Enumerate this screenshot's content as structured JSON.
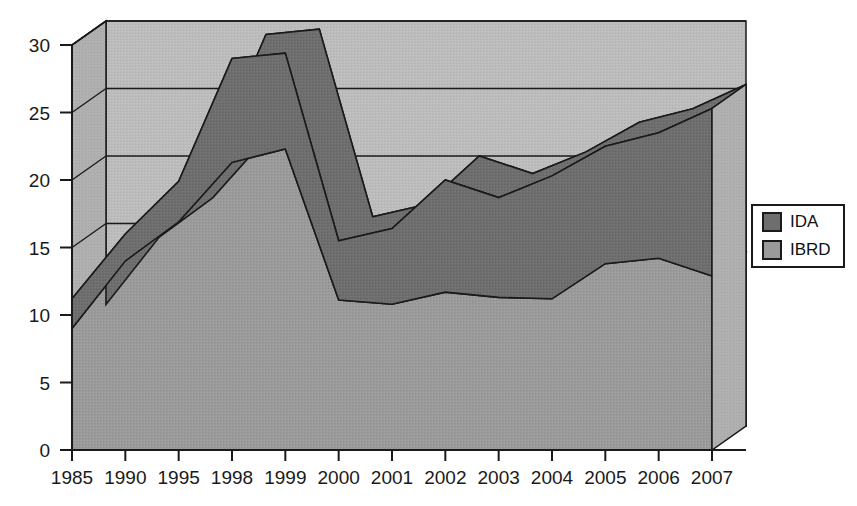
{
  "chart_data": {
    "type": "area",
    "stacked": true,
    "three_d": true,
    "title": "",
    "subtitle": "",
    "xlabel": "",
    "ylabel": "",
    "categories": [
      "1985",
      "1990",
      "1995",
      "1998",
      "1999",
      "2000",
      "2001",
      "2002",
      "2003",
      "2004",
      "2005",
      "2006",
      "2007"
    ],
    "series": [
      {
        "name": "IBRD",
        "color": "#9a9a9a",
        "values": [
          9.0,
          14.0,
          16.9,
          21.3,
          22.3,
          11.1,
          10.8,
          11.7,
          11.3,
          11.2,
          13.8,
          14.2,
          12.9
        ]
      },
      {
        "name": "IDA",
        "color": "#6e6e6e",
        "values": [
          2.2,
          2.0,
          3.0,
          7.7,
          7.1,
          4.4,
          5.6,
          8.3,
          7.4,
          9.1,
          8.7,
          9.3,
          12.4
        ]
      }
    ],
    "totals": [
      11.2,
      16.0,
      19.9,
      29.0,
      29.4,
      15.5,
      16.4,
      20.0,
      18.7,
      20.3,
      22.5,
      23.5,
      25.3
    ],
    "yticks": [
      0,
      5,
      10,
      15,
      20,
      25,
      30
    ],
    "ylim": [
      0,
      30
    ],
    "xtick_labels": [
      "1985",
      "1990",
      "1995",
      "1998",
      "1999",
      "2000",
      "2001",
      "2002",
      "2003",
      "2004",
      "2005",
      "2006",
      "2007"
    ],
    "grid": true,
    "gridlines_at": [
      15,
      20,
      25,
      30
    ],
    "legend_position": "right",
    "legend_entries": [
      "IDA",
      "IBRD"
    ]
  },
  "axis": {
    "y_ticks": [
      {
        "label": "30"
      },
      {
        "label": "25"
      },
      {
        "label": "20"
      },
      {
        "label": "15"
      },
      {
        "label": "10"
      },
      {
        "label": "5"
      },
      {
        "label": "0"
      }
    ],
    "x_ticks": [
      {
        "label": "1985"
      },
      {
        "label": "1990"
      },
      {
        "label": "1995"
      },
      {
        "label": "1998"
      },
      {
        "label": "1999"
      },
      {
        "label": "2000"
      },
      {
        "label": "2001"
      },
      {
        "label": "2002"
      },
      {
        "label": "2003"
      },
      {
        "label": "2004"
      },
      {
        "label": "2005"
      },
      {
        "label": "2006"
      },
      {
        "label": "2007"
      }
    ]
  },
  "legend": {
    "items": [
      {
        "label": "IDA",
        "color": "#6e6e6e"
      },
      {
        "label": "IBRD",
        "color": "#9a9a9a"
      }
    ]
  },
  "colors": {
    "ida_fill": "#6e6e6e",
    "ibrd_fill": "#9a9a9a",
    "back_wall": "#bcbcbc",
    "side_wall": "#b2b2b2",
    "outline": "#1a1a1a",
    "text": "#1a1a1a",
    "background": "#ffffff",
    "legend_box": "#ffffff"
  }
}
